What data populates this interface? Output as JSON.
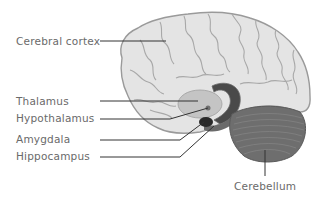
{
  "diagram": {
    "type": "anatomical-brain-sagittal",
    "colors": {
      "brain_fill": "#e4e4e4",
      "brain_outline": "#9a9a9a",
      "sulci": "#a8a8a8",
      "thalamus": "#c4c4c4",
      "hypothalamus_dot": "#707070",
      "corpus_band": "#4a4a4a",
      "amygdala": "#2a2a2a",
      "hippocampus": "#6a6a6a",
      "cerebellum": "#6e6e6e",
      "leader_line": "#333333",
      "label_text": "#6a6a6a"
    },
    "labels": [
      {
        "id": "cerebral-cortex",
        "text": "Cerebral cortex"
      },
      {
        "id": "thalamus",
        "text": "Thalamus"
      },
      {
        "id": "hypothalamus",
        "text": "Hypothalamus"
      },
      {
        "id": "amygdala",
        "text": "Amygdala"
      },
      {
        "id": "hippocampus",
        "text": "Hippocampus"
      },
      {
        "id": "cerebellum",
        "text": "Cerebellum"
      }
    ]
  }
}
